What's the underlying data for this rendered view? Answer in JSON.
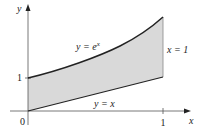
{
  "figure": {
    "axes": {
      "x_label": "x",
      "y_label": "y",
      "origin_label": "0",
      "x_tick_label": "1",
      "y_tick_label": "1"
    },
    "curves": {
      "upper": {
        "label_lhs": "y = e",
        "label_exp": "x"
      },
      "lower": {
        "label": "y = x"
      },
      "boundary": {
        "label": "x = 1"
      }
    },
    "colors": {
      "fill": "#d9d9d9",
      "curve": "#222222",
      "axis": "#555555",
      "boundary_line": "#888888"
    }
  }
}
